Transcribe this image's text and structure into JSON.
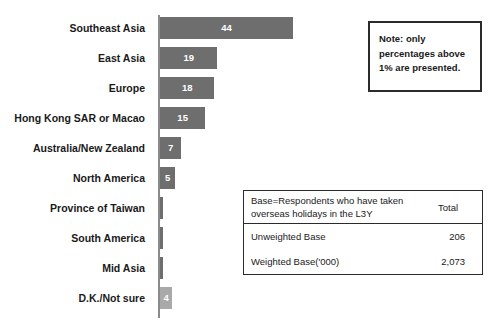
{
  "chart_data": {
    "type": "bar",
    "orientation": "horizontal",
    "title": "",
    "xlabel": "",
    "ylabel": "",
    "categories": [
      "Southeast Asia",
      "East Asia",
      "Europe",
      "Hong Kong SAR or Macao",
      "Australia/New Zealand",
      "North America",
      "Province of Taiwan",
      "South America",
      "Mid Asia",
      "D.K./Not sure"
    ],
    "values": [
      44,
      19,
      18,
      15,
      7,
      5,
      1,
      1,
      1,
      4
    ],
    "value_labels": [
      "44",
      "19",
      "18",
      "15",
      "7",
      "5",
      "",
      "",
      "",
      "4"
    ],
    "bar_colors": [
      "#6e6e6e",
      "#6e6e6e",
      "#6e6e6e",
      "#6e6e6e",
      "#6e6e6e",
      "#6e6e6e",
      "#6e6e6e",
      "#6e6e6e",
      "#6e6e6e",
      "#a9a9a9"
    ],
    "xlim": [
      0,
      46
    ],
    "grid": false,
    "legend": false,
    "units": "percent"
  },
  "note_box": {
    "line1": "Note: only",
    "line2": "percentages above",
    "line3": "1% are presented."
  },
  "base_table": {
    "header_label_line1": "Base=Respondents who have taken",
    "header_label_line2": "overseas holidays in the L3Y",
    "header_total": "Total",
    "rows": [
      {
        "label": "Unweighted Base",
        "value": "206"
      },
      {
        "label": "Weighted Base('000)",
        "value": "2,073"
      }
    ]
  }
}
